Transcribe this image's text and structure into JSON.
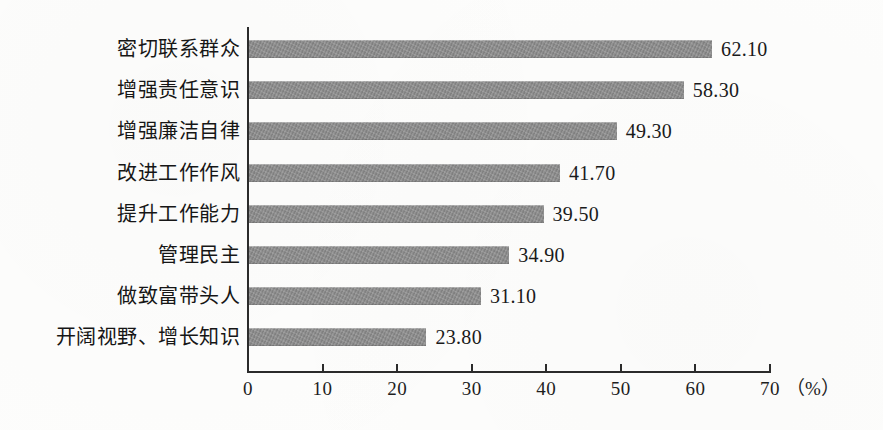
{
  "chart_data": {
    "type": "bar",
    "orientation": "horizontal",
    "title": "",
    "subtitle": "",
    "xlabel": "（%）",
    "ylabel": "",
    "categories": [
      "密切联系群众",
      "增强责任意识",
      "增强廉洁自律",
      "改进工作作风",
      "提升工作能力",
      "管理民主",
      "做致富带头人",
      "开阔视野、增长知识"
    ],
    "values": [
      62.1,
      58.3,
      49.3,
      41.7,
      39.5,
      34.9,
      31.1,
      23.8
    ],
    "value_labels": [
      "62.10",
      "58.30",
      "49.30",
      "41.70",
      "39.50",
      "34.90",
      "31.10",
      "23.80"
    ],
    "xlim": [
      0,
      70
    ],
    "xticks": [
      0,
      10,
      20,
      30,
      40,
      50,
      60,
      70
    ],
    "xtick_labels": [
      "0",
      "10",
      "20",
      "30",
      "40",
      "50",
      "60",
      "70"
    ],
    "grid": false,
    "legend": null,
    "bar_color": "#8b8b8b",
    "axis_color": "#2b2b2b",
    "background": "#ffffff"
  }
}
